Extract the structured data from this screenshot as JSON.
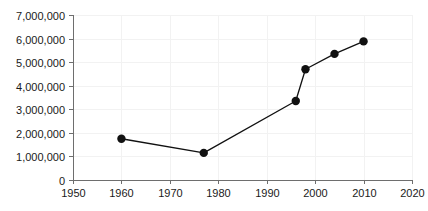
{
  "chart_data": {
    "type": "line",
    "title": "",
    "subtitle": "",
    "xlabel": "",
    "ylabel": "",
    "xlim": [
      1950,
      2020
    ],
    "ylim": [
      0,
      7000000
    ],
    "grid": true,
    "legend": false,
    "legend_position": "none",
    "x_ticks": [
      1950,
      1960,
      1970,
      1980,
      1990,
      2000,
      2010,
      2020
    ],
    "x_tick_labels": [
      "1950",
      "1960",
      "1970",
      "1980",
      "1990",
      "2000",
      "2010",
      "2020"
    ],
    "y_ticks": [
      0,
      1000000,
      2000000,
      3000000,
      4000000,
      5000000,
      6000000,
      7000000
    ],
    "y_tick_labels": [
      "0",
      "1,000,000",
      "2,000,000",
      "3,000,000",
      "4,000,000",
      "5,000,000",
      "6,000,000",
      "7,000,000"
    ],
    "series": [
      {
        "name": "series-1",
        "color": "#111111",
        "marker": "circle",
        "points": [
          {
            "x": 1960,
            "y": 1750000
          },
          {
            "x": 1977,
            "y": 1150000
          },
          {
            "x": 1996,
            "y": 3350000
          },
          {
            "x": 1998,
            "y": 4700000
          },
          {
            "x": 2004,
            "y": 5350000
          },
          {
            "x": 2010,
            "y": 5880000
          }
        ]
      }
    ],
    "colors": {
      "line": "#111111",
      "marker": "#111111",
      "grid": "#f2f2f2",
      "axis": "#6e6e6e",
      "text": "#1a1a1a",
      "background": "#ffffff"
    },
    "geometry": {
      "plot_left": 73,
      "plot_right": 412,
      "plot_top": 15,
      "plot_bottom": 180,
      "marker_radius": 4.2
    }
  }
}
